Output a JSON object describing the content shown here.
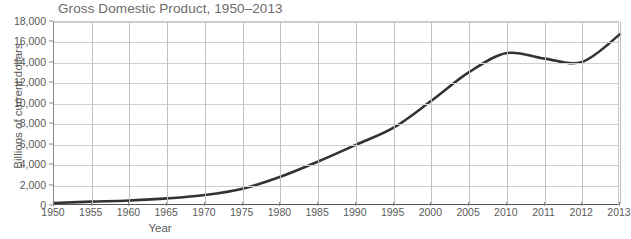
{
  "chart_data": {
    "type": "line",
    "title": "Gross Domestic Product, 1950–2013",
    "xlabel": "Year",
    "ylabel": "Billions of current dollars",
    "ylim": [
      0,
      18000
    ],
    "ytick_labels": [
      "0",
      "2,000",
      "4,000",
      "6,000",
      "8,000",
      "10,000",
      "12,000",
      "14,000",
      "16,000",
      "18,000"
    ],
    "ytick_values": [
      0,
      2000,
      4000,
      6000,
      8000,
      10000,
      12000,
      14000,
      16000,
      18000
    ],
    "xtick_labels": [
      "1950",
      "1955",
      "1960",
      "1965",
      "1970",
      "1975",
      "1980",
      "1985",
      "1990",
      "1995",
      "2000",
      "2005",
      "2010",
      "2011",
      "2012",
      "2013"
    ],
    "xtick_values": [
      1950,
      1955,
      1960,
      1965,
      1970,
      1975,
      1980,
      1985,
      1990,
      1995,
      2000,
      2005,
      2010,
      2011,
      2012,
      2013
    ],
    "axis_note": "x-axis spacing is uniform per labeled tick: 5-year steps through 2010, then annual 2011-2013",
    "grid": true,
    "legend": "none",
    "line_color": "#333333",
    "grid_color": "#cfcfcf",
    "series": [
      {
        "name": "Gross Domestic Product",
        "x": [
          1950,
          1955,
          1960,
          1965,
          1970,
          1975,
          1980,
          1985,
          1990,
          1995,
          2000,
          2005,
          2010,
          2011,
          2012,
          2013
        ],
        "values": [
          300,
          425,
          545,
          745,
          1075,
          1690,
          2860,
          4350,
          5980,
          7660,
          10290,
          13090,
          14960,
          14420,
          14100,
          16800
        ]
      }
    ]
  }
}
